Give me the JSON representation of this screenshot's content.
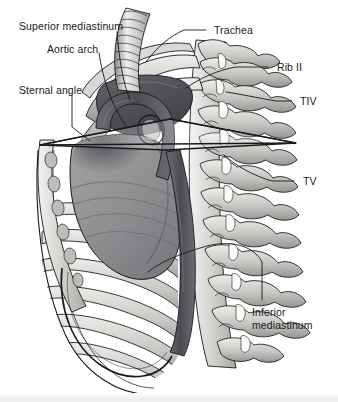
{
  "figure": {
    "type": "anatomical-illustration",
    "style": "grayscale-medical-line-and-wash",
    "background_color": "#ffffff",
    "ink_color": "#17181a",
    "width": 338,
    "height": 402
  },
  "labels": {
    "superior_mediastinum": "Superior mediastinum",
    "aortic_arch": "Aortic arch",
    "sternal_angle": "Sternal angle",
    "trachea": "Trachea",
    "rib_ii": "Rib II",
    "tiv": "TIV",
    "tv": "TV",
    "inferior_mediastinum_line1": "Inferior",
    "inferior_mediastinum_line2": "mediastinum"
  },
  "structures": {
    "trachea": "trachea-tube",
    "aortic_arch": "aortic-arch",
    "descending_aorta": "descending-aorta",
    "heart": "heart-mass",
    "vertebral_column": "thoracic-vertebrae",
    "ribs": "rib-cage",
    "sternum": "sternum",
    "transverse_plane": "sternal-angle-transverse-plane",
    "costal_cartilage": "costal-cartilage"
  },
  "palette": {
    "bone_light": "#e8e8e6",
    "bone_mid": "#c9c9c6",
    "bone_shadow": "#9b9b98",
    "soft_tissue": "#9a9a9c",
    "soft_tissue_dark": "#6e6e72",
    "vessel_dark": "#55555b",
    "vessel_darkest": "#3c3c42",
    "outline": "#17181a",
    "white_space": "#ffffff"
  },
  "counts": {
    "vertebrae_visible": 9,
    "ribs_visible": 10,
    "trachea_rings": 12
  }
}
